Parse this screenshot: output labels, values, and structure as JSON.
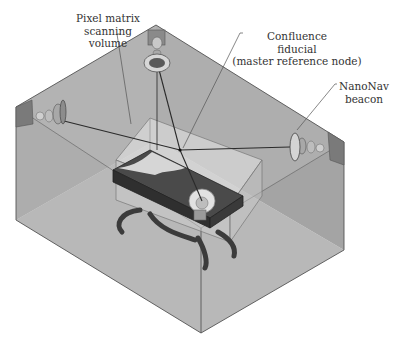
{
  "figure": {
    "type": "isometric system schematic",
    "labels": {
      "pixel_matrix": [
        "Pixel matrix",
        "scanning",
        "volume"
      ],
      "confluence": [
        "Confluence",
        "fiducial",
        "(master reference node)"
      ],
      "nanonav": [
        "NanoNav",
        "beacon"
      ]
    },
    "components": [
      {
        "name": "top-beacon",
        "description": "ceiling-mounted beacon"
      },
      {
        "name": "left-beacon",
        "description": "left-wall beacon"
      },
      {
        "name": "right-beacon",
        "description": "NanoNav beacon on right wall"
      },
      {
        "name": "front-beacon",
        "description": "beacon at front of table"
      },
      {
        "name": "scanning-volume",
        "description": "transparent pixel matrix scanning volume box"
      },
      {
        "name": "patient-table",
        "description": "table with curved legs"
      },
      {
        "name": "confluence-fiducial",
        "description": "master reference node where beams converge"
      }
    ],
    "colors": {
      "room_wall_back": "#a9a9a9",
      "room_wall_side": "#999999",
      "room_floor": "#c4c4c4",
      "edge": "#555555",
      "table": "#3d3d3d",
      "volume_fill": "#d8d8d8",
      "beam": "#2a2a2a",
      "text": "#333333"
    }
  }
}
